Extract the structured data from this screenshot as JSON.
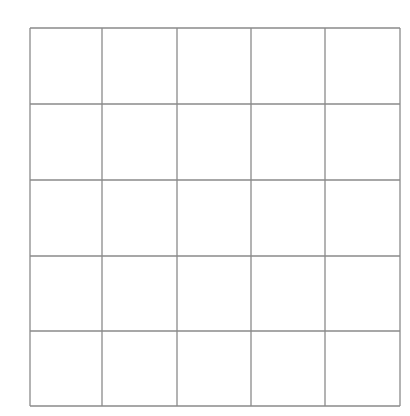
{
  "grid": {
    "rows": 5,
    "cols": 5,
    "x_lines": [
      30,
      102,
      177,
      251,
      325,
      400
    ],
    "y_lines": [
      28,
      104,
      180,
      256,
      331,
      406
    ],
    "line_color": "#8a8a8a",
    "background": "#ffffff",
    "cells_filled": []
  }
}
